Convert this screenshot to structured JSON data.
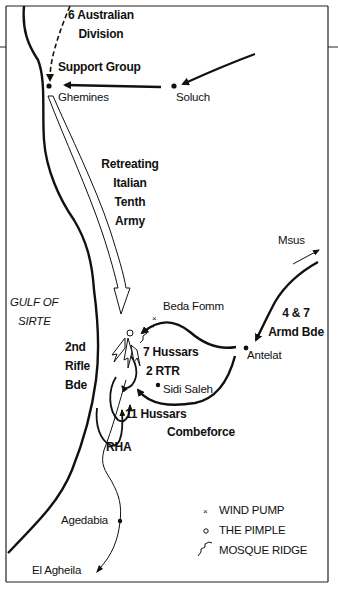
{
  "map": {
    "title": "Battle of Beda Fomm",
    "places": {
      "ghemines": "Ghemines",
      "soluch": "Soluch",
      "msus": "Msus",
      "beda_fomm": "Beda Fomm",
      "antelat": "Antelat",
      "sidi_saleh": "Sidi Saleh",
      "agedabia": "Agedabia",
      "el_agheila": "El Agheila"
    },
    "water": {
      "gulf_line1": "GULF OF",
      "gulf_line2": "SIRTE"
    },
    "units": {
      "aus_div_line1": "6 Australian",
      "aus_div_line2": "Division",
      "support_group": "Support Group",
      "italian_line1": "Retreating",
      "italian_line2": "Italian",
      "italian_line3": "Tenth",
      "italian_line4": "Army",
      "armd_line1": "4 & 7",
      "armd_line2": "Armd Bde",
      "rifle_line1": "2nd",
      "rifle_line2": "Rifle",
      "rifle_line3": "Bde",
      "hussars7": "7 Hussars",
      "rtr2": "2 RTR",
      "hussars11": "11 Hussars",
      "combeforce": "Combeforce",
      "rha": "RHA"
    },
    "legend": {
      "items": [
        {
          "symbol": "×",
          "icon": "wind-pump-icon",
          "label": "WIND PUMP"
        },
        {
          "symbol": "○",
          "icon": "pimple-icon",
          "label": "THE PIMPLE"
        },
        {
          "symbol": "zigzag",
          "icon": "mosque-ridge-icon",
          "label": "MOSQUE RIDGE"
        }
      ]
    },
    "colors": {
      "ink": "#111111",
      "background": "#ffffff"
    }
  }
}
